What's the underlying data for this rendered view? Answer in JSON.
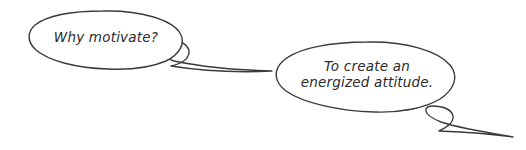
{
  "canvas": {
    "width": 526,
    "height": 150,
    "background_color": "#ffffff"
  },
  "style": {
    "stroke_color": "#3a3a3a",
    "fill_color": "#ffffff",
    "text_color": "#2b2b2b",
    "stroke_width": 1.4
  },
  "diagram": {
    "type": "speech-bubble-conversation",
    "bubbles": [
      {
        "id": "question",
        "role": "question",
        "text": "Why motivate?",
        "lines": [
          "Why motivate?"
        ],
        "tail_direction": "right-down"
      },
      {
        "id": "answer",
        "role": "answer",
        "text": "To create an energized attitude.",
        "lines": [
          "To create an",
          "energized attitude."
        ],
        "tail_direction": "right-down"
      }
    ]
  }
}
